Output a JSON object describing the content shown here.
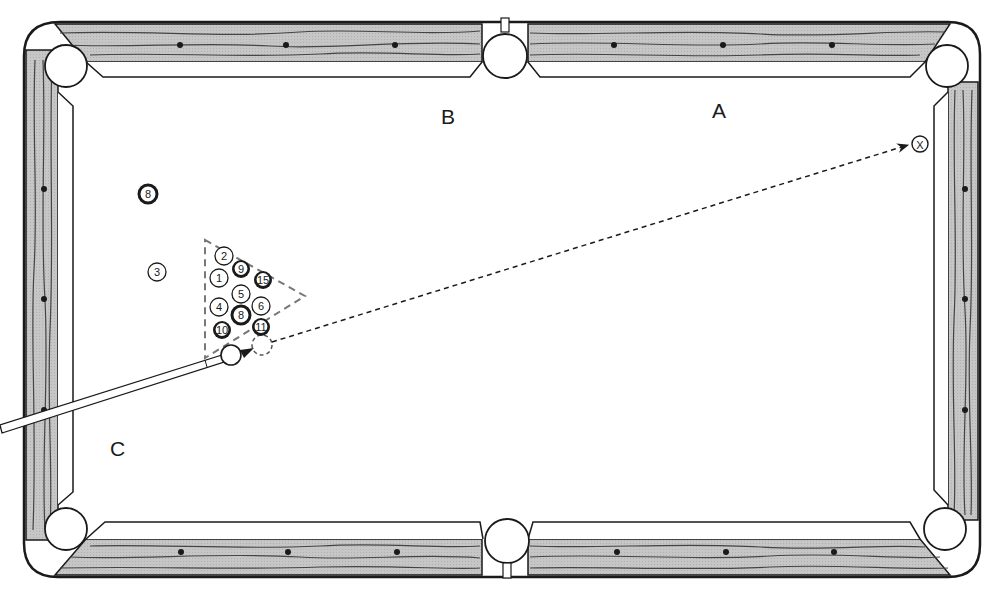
{
  "diagram": {
    "felt_color": "#ffffff",
    "rail_color": "#c4c4c4",
    "outline_color": "#1a1a1a",
    "labels": [
      {
        "id": "A",
        "text": "A"
      },
      {
        "id": "B",
        "text": "B"
      },
      {
        "id": "C",
        "text": "C"
      }
    ],
    "target_marker": {
      "symbol": "X",
      "meaning": "aim point"
    },
    "rack": {
      "shape": "triangle",
      "style": "dashed",
      "balls": [
        {
          "number": "2",
          "type": "solid"
        },
        {
          "number": "9",
          "type": "stripe"
        },
        {
          "number": "1",
          "type": "solid"
        },
        {
          "number": "15",
          "type": "stripe"
        },
        {
          "number": "5",
          "type": "solid"
        },
        {
          "number": "4",
          "type": "solid"
        },
        {
          "number": "6",
          "type": "solid"
        },
        {
          "number": "8",
          "type": "eight"
        },
        {
          "number": "10",
          "type": "stripe"
        },
        {
          "number": "11",
          "type": "stripe"
        }
      ]
    },
    "loose_balls": [
      {
        "number": "8",
        "type": "eight"
      },
      {
        "number": "3",
        "type": "solid"
      }
    ],
    "cue_ball": {
      "label": "cue ball"
    },
    "shot_line": {
      "style": "dashed",
      "direction": "toward X"
    },
    "pockets": [
      "top-left",
      "top-middle",
      "top-right",
      "bottom-left",
      "bottom-middle",
      "bottom-right"
    ],
    "diamonds_per_long_rail_half": 3,
    "diamonds_per_short_rail": 3
  }
}
